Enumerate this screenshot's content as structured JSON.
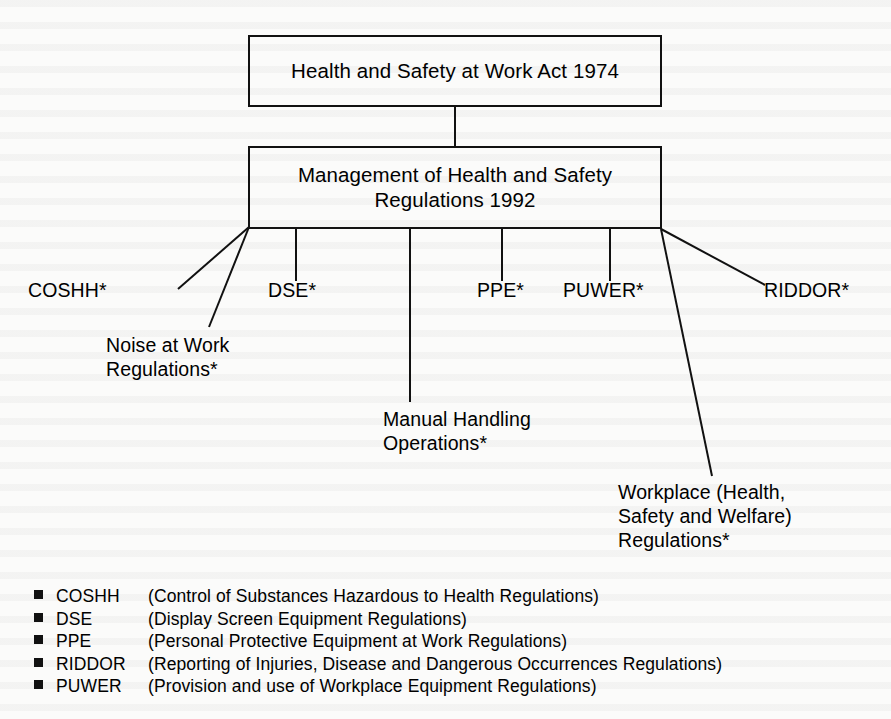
{
  "diagram": {
    "type": "hierarchy-tree",
    "root": {
      "id": "hswa",
      "label": "Health and Safety at Work Act 1974"
    },
    "second_level": {
      "id": "mhsr",
      "label": "Management of Health and Safety\nRegulations 1992"
    },
    "branches": [
      {
        "id": "coshh",
        "label": "COSHH*"
      },
      {
        "id": "noise",
        "label": "Noise at Work\nRegulations*"
      },
      {
        "id": "dse",
        "label": "DSE*"
      },
      {
        "id": "manual-handling",
        "label": "Manual Handling\nOperations*"
      },
      {
        "id": "ppe",
        "label": "PPE*"
      },
      {
        "id": "puwer",
        "label": "PUWER*"
      },
      {
        "id": "workplace",
        "label": "Workplace (Health,\nSafety and Welfare)\nRegulations*"
      },
      {
        "id": "riddor",
        "label": "RIDDOR*"
      }
    ]
  },
  "legend": {
    "rows": [
      {
        "abbr": "COSHH",
        "description": "(Control of Substances Hazardous to Health Regulations)"
      },
      {
        "abbr": "DSE",
        "description": "(Display Screen Equipment Regulations)"
      },
      {
        "abbr": "PPE",
        "description": "(Personal Protective Equipment at Work Regulations)"
      },
      {
        "abbr": "RIDDOR",
        "description": "(Reporting of Injuries, Disease and Dangerous Occurrences Regulations)"
      },
      {
        "abbr": "PUWER",
        "description": "(Provision and use of Workplace Equipment Regulations)"
      }
    ]
  },
  "colors": {
    "ink": "#111111",
    "page": "#fbfbfa"
  }
}
